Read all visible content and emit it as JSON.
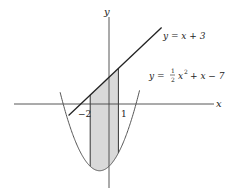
{
  "figure": {
    "axes": {
      "x_label": "x",
      "y_label": "y"
    },
    "line": {
      "equation": "y = x + 3",
      "label": "y = x + 3"
    },
    "parabola": {
      "equation": "y = 1/2 x^2 + x - 7",
      "label_prefix": "y = ",
      "label_frac_num": "1",
      "label_frac_den": "2",
      "label_x": "x",
      "label_exp": "2",
      "label_suffix": "+ x − 7"
    },
    "shaded_region": {
      "from": -2,
      "to": 1,
      "color": "#d9d9d9"
    },
    "ticks": [
      {
        "value": -2,
        "label": "−2"
      },
      {
        "value": 1,
        "label": "1"
      }
    ],
    "colors": {
      "line": "#222222",
      "parabola": "#555555",
      "axes": "#444444",
      "shade": "#d9d9d9"
    }
  }
}
